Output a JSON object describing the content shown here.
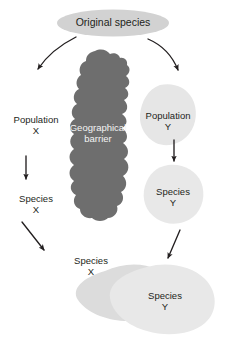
{
  "figure": {
    "colors": {
      "background": "#ffffff",
      "original_species_fill": "#d2d2d2",
      "barrier_fill": "#6e6e6e",
      "population_blob_fill": "#e6e6e6",
      "species_y_blob_fill": "#e8e8e8",
      "species_x_blob_fill": "#dcdcdc",
      "arrow_color": "#231f20",
      "text_dark": "#231f20",
      "text_light": "#f4f4f4"
    }
  },
  "nodes": {
    "original_species": {
      "label": "Original species",
      "shape": "ellipse",
      "text_color": "dark"
    },
    "barrier": {
      "label_line1": "Geographical",
      "label_line2": "barrier",
      "shape": "blob",
      "text_color": "light"
    },
    "population_x": {
      "label_line1": "Population",
      "label_line2": "X",
      "shape": "text-only",
      "text_color": "dark"
    },
    "population_y": {
      "label_line1": "Population",
      "label_line2": "Y",
      "shape": "blob",
      "text_color": "dark"
    },
    "species_x_mid": {
      "label_line1": "Species",
      "label_line2": "X",
      "shape": "text-only",
      "text_color": "dark"
    },
    "species_y_mid": {
      "label_line1": "Species",
      "label_line2": "Y",
      "shape": "blob",
      "text_color": "dark"
    },
    "species_x_bottom": {
      "label_line1": "Species",
      "label_line2": "X",
      "shape": "blob",
      "text_color": "dark"
    },
    "species_y_bottom": {
      "label_line1": "Species",
      "label_line2": "Y",
      "shape": "blob",
      "text_color": "dark"
    }
  },
  "arrows": [
    {
      "name": "arrow-original-to-population-x",
      "style": "curved",
      "direction": "down-left"
    },
    {
      "name": "arrow-original-to-population-y",
      "style": "curved",
      "direction": "down-right"
    },
    {
      "name": "arrow-population-x-to-species-x",
      "style": "straight",
      "direction": "down"
    },
    {
      "name": "arrow-population-y-to-species-y",
      "style": "straight",
      "direction": "down"
    },
    {
      "name": "arrow-species-x-to-bottom",
      "style": "straight",
      "direction": "down-right"
    },
    {
      "name": "arrow-species-y-to-bottom",
      "style": "straight",
      "direction": "down-left"
    }
  ]
}
